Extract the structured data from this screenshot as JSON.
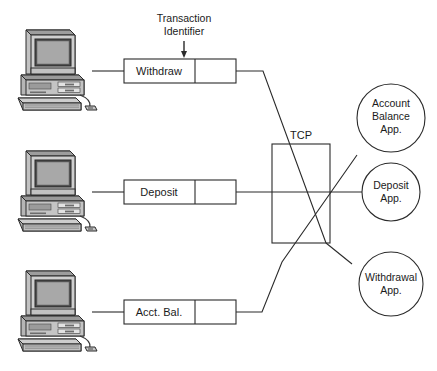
{
  "diagram": {
    "annotation": {
      "name": "transaction-identifier-annotation",
      "line1": "Transaction",
      "line2": "Identifier",
      "arrow": "down-arrow-icon"
    },
    "network_label": "TCP",
    "clients": [
      {
        "id": "client-withdraw",
        "icon": "desktop-computer-icon"
      },
      {
        "id": "client-deposit",
        "icon": "desktop-computer-icon"
      },
      {
        "id": "client-acct-bal",
        "icon": "desktop-computer-icon"
      }
    ],
    "messages": [
      {
        "id": "message-withdraw",
        "label": "Withdraw",
        "data_cell": ""
      },
      {
        "id": "message-deposit",
        "label": "Deposit",
        "data_cell": ""
      },
      {
        "id": "message-acct-bal",
        "label": "Acct. Bal.",
        "data_cell": ""
      }
    ],
    "applications": [
      {
        "id": "app-account-balance",
        "lines": [
          "Account",
          "Balance",
          "App."
        ]
      },
      {
        "id": "app-deposit",
        "lines": [
          "Deposit",
          "App."
        ]
      },
      {
        "id": "app-withdrawal",
        "lines": [
          "Withdrawal",
          "App."
        ]
      }
    ],
    "colors": {
      "stroke": "#1b1b1b",
      "background": "#ffffff",
      "computer_body": "#b9b9b9",
      "computer_light": "#d6d6d6",
      "computer_dark": "#8a8a8a",
      "screen": "#a9a9a9"
    }
  }
}
